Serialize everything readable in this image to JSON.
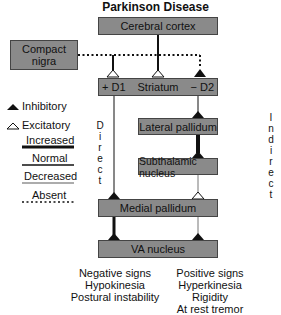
{
  "title": "Parkinson Disease",
  "boxes": {
    "cortex": "Cerebral cortex",
    "nigra_line1": "Compact",
    "nigra_line2": "nigra",
    "striatum_d1": "+ D1",
    "striatum": "Striatum",
    "striatum_d2": "− D2",
    "lateral_pallidum": "Lateral pallidum",
    "subthalamic": "Subthalamic nucleus",
    "medial_pallidum": "Medial pallidum",
    "va_nucleus": "VA nucleus"
  },
  "pathways": {
    "direct": [
      "D",
      "i",
      "r",
      "e",
      "c",
      "t"
    ],
    "indirect": [
      "I",
      "n",
      "d",
      "i",
      "r",
      "e",
      "c",
      "t"
    ]
  },
  "legend": {
    "inhibitory": "Inhibitory",
    "excitatory": "Excitatory",
    "increased": "Increased",
    "normal": "Normal",
    "decreased": "Decreased",
    "absent": "Absent"
  },
  "outcomes": {
    "negative": [
      "Negative signs",
      "Hypokinesia",
      "Postural instability"
    ],
    "positive": [
      "Positive signs",
      "Hyperkinesia",
      "Rigidity",
      "At rest tremor"
    ]
  },
  "colors": {
    "box_fill": "#8a8a8a",
    "box_border": "#444444",
    "line": "#111111"
  }
}
